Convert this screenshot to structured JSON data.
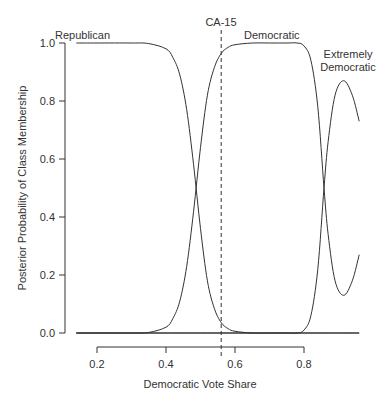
{
  "chart_data": {
    "type": "line",
    "title": "",
    "xlabel": "Democratic Vote Share",
    "ylabel": "Posterior Probability of Class Membership",
    "xlim": [
      0.14,
      0.96
    ],
    "ylim": [
      0.0,
      1.0
    ],
    "xticks": [
      "0.2",
      "0.4",
      "0.6",
      "0.8"
    ],
    "yticks": [
      "0.0",
      "0.2",
      "0.4",
      "0.6",
      "0.8",
      "1.0"
    ],
    "grid": false,
    "x": [
      0.14,
      0.2,
      0.3,
      0.35,
      0.4,
      0.42,
      0.44,
      0.46,
      0.48,
      0.5,
      0.52,
      0.54,
      0.56,
      0.58,
      0.6,
      0.65,
      0.7,
      0.75,
      0.78,
      0.8,
      0.82,
      0.84,
      0.858,
      0.87,
      0.89,
      0.915,
      0.94,
      0.96
    ],
    "series": [
      {
        "name": "Republican",
        "values": [
          1.0,
          1.0,
          1.0,
          0.998,
          0.98,
          0.95,
          0.89,
          0.77,
          0.58,
          0.36,
          0.18,
          0.085,
          0.036,
          0.015,
          0.006,
          0.0,
          0.0,
          0.0,
          0.0,
          0.0,
          0.0,
          0.0,
          0.0,
          0.0,
          0.0,
          0.0,
          0.0,
          0.0
        ]
      },
      {
        "name": "Democratic",
        "values": [
          0.0,
          0.0,
          0.0,
          0.002,
          0.02,
          0.05,
          0.11,
          0.23,
          0.42,
          0.64,
          0.82,
          0.915,
          0.964,
          0.985,
          0.994,
          1.0,
          1.0,
          1.0,
          1.0,
          0.99,
          0.94,
          0.78,
          0.5,
          0.34,
          0.18,
          0.13,
          0.18,
          0.27
        ]
      },
      {
        "name": "Extremely Democratic",
        "values": [
          0.0,
          0.0,
          0.0,
          0.0,
          0.0,
          0.0,
          0.0,
          0.0,
          0.0,
          0.0,
          0.0,
          0.0,
          0.0,
          0.0,
          0.0,
          0.0,
          0.0,
          0.0,
          0.0,
          0.01,
          0.06,
          0.22,
          0.5,
          0.66,
          0.82,
          0.87,
          0.82,
          0.73
        ]
      }
    ],
    "annotations": [
      {
        "text": "Republican",
        "x": 0.18,
        "y": 1.02
      },
      {
        "text": "Democratic",
        "x": 0.68,
        "y": 1.02
      },
      {
        "text": "Extremely",
        "x": 0.915,
        "y": 0.93
      },
      {
        "text": "Democratic",
        "x": 0.915,
        "y": 0.89
      },
      {
        "text": "CA-15",
        "x": 0.56,
        "y": 1.06
      }
    ],
    "vline": {
      "x": 0.56,
      "label": "CA-15",
      "style": "dashed"
    }
  },
  "labels": {
    "republican": "Republican",
    "democratic": "Democratic",
    "extremely_1": "Extremely",
    "extremely_2": "Democratic",
    "ca15": "CA-15",
    "xlabel": "Democratic Vote Share",
    "ylabel": "Posterior Probability of Class Membership"
  }
}
